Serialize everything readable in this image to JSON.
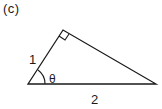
{
  "figure": {
    "panel_label": "(c)",
    "side_adjacent_label": "1",
    "angle_label": "θ",
    "side_base_label": "2",
    "shape": "right-triangle",
    "right_angle_marker": true,
    "stroke_color": "#1a1a1a",
    "background_color": "#ffffff"
  }
}
